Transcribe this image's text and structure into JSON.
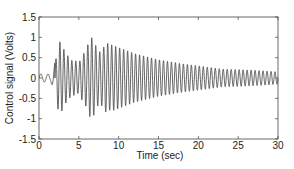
{
  "chart_data": {
    "type": "line",
    "title": "",
    "xlabel": "Time (sec)",
    "ylabel": "Control signal (Volts)",
    "xlim": [
      0,
      30
    ],
    "ylim": [
      -1.5,
      1.5
    ],
    "xticks": [
      0,
      5,
      10,
      15,
      20,
      25,
      30
    ],
    "yticks": [
      -1.5,
      -1,
      -0.5,
      0,
      0.5,
      1,
      1.5
    ],
    "ytick_labels": [
      "-1.5",
      "-1",
      "-0.5",
      "0",
      "0.5",
      "1",
      "1.5"
    ],
    "xtick_labels": [
      "0",
      "5",
      "10",
      "15",
      "20",
      "25",
      "30"
    ],
    "grid": false,
    "legend": null,
    "series": [
      {
        "name": "Control signal",
        "color": "#555555",
        "description": "Oscillating control signal: small (~±0.1 V) oscillation for t<2 s, large bursts starting ~2 s (peaks ~0.9 V), reduced amplitude ~4–5 s, maximum ~1.0 V near 6.5 s, then gradual decay to ~±0.15 V by 30 s. Oscillation period ~0.5 s.",
        "envelope": {
          "t": [
            0,
            1.5,
            2.0,
            2.5,
            3.5,
            4.2,
            5.0,
            5.5,
            6.5,
            8,
            10,
            12,
            15,
            18,
            20,
            23,
            26,
            28,
            30
          ],
          "amp": [
            0.1,
            0.1,
            0.4,
            0.9,
            0.85,
            0.45,
            0.4,
            0.85,
            1.0,
            0.9,
            0.75,
            0.6,
            0.45,
            0.35,
            0.3,
            0.22,
            0.2,
            0.18,
            0.15
          ]
        },
        "period_sec": 0.5
      }
    ]
  }
}
